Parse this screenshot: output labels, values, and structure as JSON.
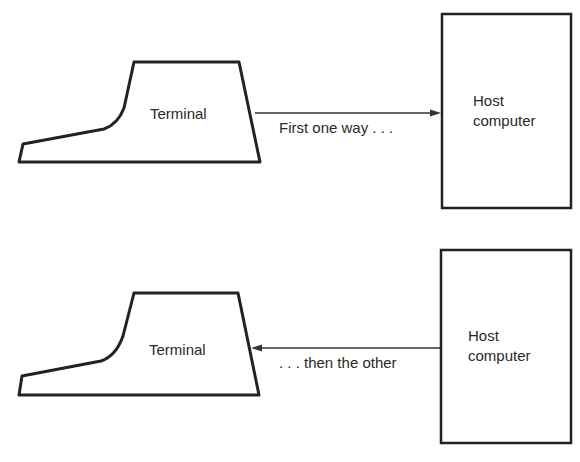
{
  "diagram": {
    "top_panel": {
      "terminal_label": "Terminal",
      "arrow_label": "First one way . . .",
      "arrow_direction": "terminal-to-host",
      "host_label_line1": "Host",
      "host_label_line2": "computer"
    },
    "bottom_panel": {
      "terminal_label": "Terminal",
      "arrow_label": ". . . then the other",
      "arrow_direction": "host-to-terminal",
      "host_label_line1": "Host",
      "host_label_line2": "computer"
    },
    "colors": {
      "stroke": "#222222",
      "background": "#ffffff"
    }
  }
}
